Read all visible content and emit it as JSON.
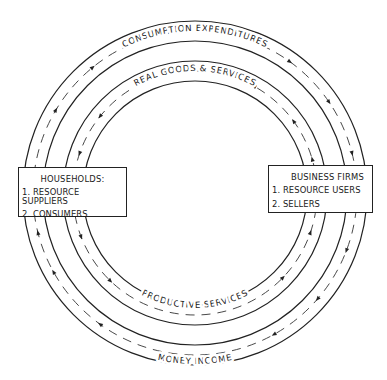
{
  "diagram": {
    "type": "circular-flow",
    "center": [
      195,
      193
    ],
    "outer_loop": {
      "top_label": "CONSUMPTION EXPENDITURES",
      "bottom_label": "MONEY INCOME",
      "direction": "clockwise"
    },
    "inner_loop": {
      "top_label": "REAL GOODS & SERVICES",
      "bottom_label": "PRODUCTIVE SERVICES",
      "direction": "counter-clockwise"
    },
    "households": {
      "title": "HOUSEHOLDS:",
      "items": [
        "1. RESOURCE SUPPLIERS",
        "2. CONSUMERS"
      ]
    },
    "firms": {
      "title": "BUSINESS FIRMS",
      "items": [
        "1. RESOURCE USERS",
        "2. SELLERS"
      ]
    },
    "colors": {
      "line": "#222222",
      "background": "#ffffff"
    }
  }
}
